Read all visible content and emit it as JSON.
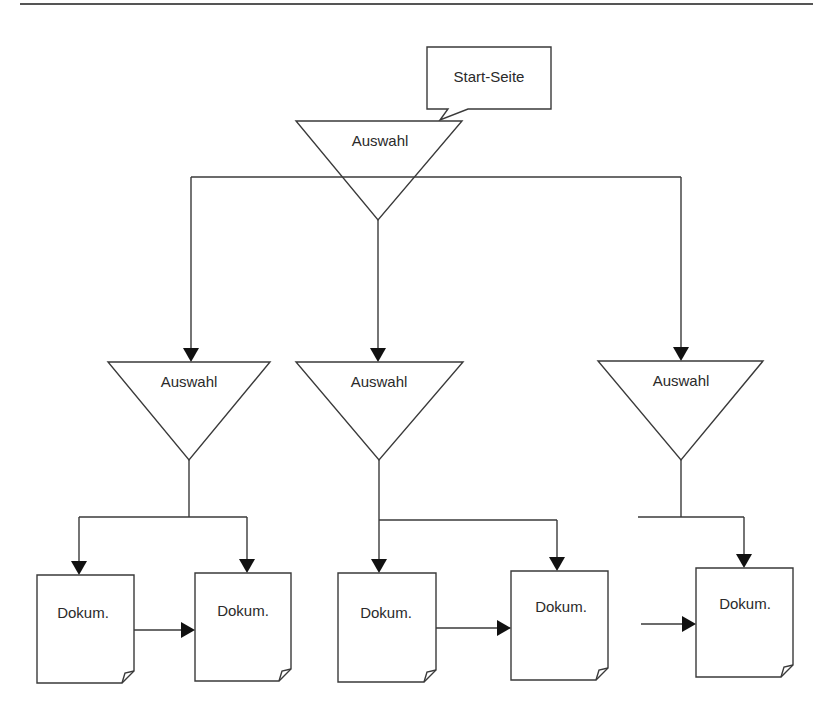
{
  "diagram": {
    "type": "flowchart",
    "callout": {
      "label": "Start-Seite"
    },
    "nodes": [
      {
        "id": "root",
        "shape": "triangle-down",
        "label": "Auswahl"
      },
      {
        "id": "sel_left",
        "shape": "triangle-down",
        "label": "Auswahl"
      },
      {
        "id": "sel_mid",
        "shape": "triangle-down",
        "label": "Auswahl"
      },
      {
        "id": "sel_right",
        "shape": "triangle-down",
        "label": "Auswahl"
      },
      {
        "id": "doc1",
        "shape": "document",
        "label": "Dokum."
      },
      {
        "id": "doc2",
        "shape": "document",
        "label": "Dokum."
      },
      {
        "id": "doc3",
        "shape": "document",
        "label": "Dokum."
      },
      {
        "id": "doc4",
        "shape": "document",
        "label": "Dokum."
      },
      {
        "id": "doc5",
        "shape": "document",
        "label": "Dokum."
      }
    ],
    "edges": [
      {
        "from": "root",
        "to": "sel_left"
      },
      {
        "from": "root",
        "to": "sel_mid"
      },
      {
        "from": "root",
        "to": "sel_right"
      },
      {
        "from": "sel_left",
        "to": "doc1"
      },
      {
        "from": "sel_left",
        "to": "doc2"
      },
      {
        "from": "doc1",
        "to": "doc2"
      },
      {
        "from": "sel_mid",
        "to": "doc3"
      },
      {
        "from": "sel_mid",
        "to": "doc4"
      },
      {
        "from": "doc3",
        "to": "doc4"
      },
      {
        "from": "sel_right",
        "to": "doc5"
      },
      {
        "from": "external",
        "to": "doc5"
      }
    ],
    "colors": {
      "stroke": "#3a3a3a",
      "arrow": "#111111",
      "background": "#ffffff"
    }
  }
}
